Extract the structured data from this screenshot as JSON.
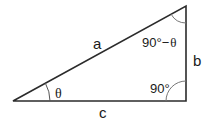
{
  "diagram": {
    "colors": {
      "stroke": "#2b2b2b",
      "text": "#1a1a1a",
      "background": "#ffffff"
    },
    "sides": {
      "hypotenuse": "a",
      "vertical": "b",
      "base": "c"
    },
    "angles": {
      "bottom_left": "θ",
      "top_right_prefix": "90°−",
      "top_right_theta": "θ",
      "bottom_right": "90°"
    }
  }
}
